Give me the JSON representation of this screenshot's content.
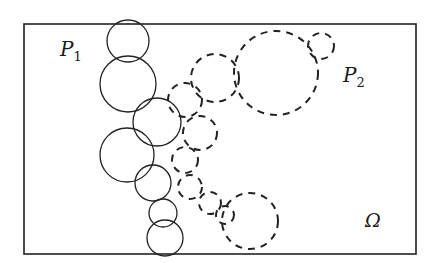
{
  "diagram": {
    "colors": {
      "stroke": "#222222",
      "background": "#ffffff"
    },
    "labels": {
      "p1": {
        "base": "P",
        "sub": "1"
      },
      "p2": {
        "base": "P",
        "sub": "2"
      },
      "omega": "Ω"
    },
    "legend": [
      {
        "set": "P1",
        "style": "solid"
      },
      {
        "set": "P2",
        "style": "dashed"
      }
    ],
    "solid_circle_count": 7,
    "dashed_circle_count": 10
  }
}
